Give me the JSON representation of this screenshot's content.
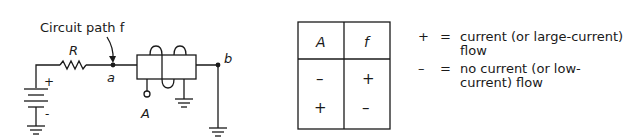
{
  "circuit": {
    "title_label": "Circuit path f",
    "resistor_label": "R",
    "node_a_label": "a",
    "node_b_label": "b",
    "input_label": "A",
    "battery_plus": "+",
    "battery_minus": "-"
  },
  "truth_table": {
    "headers": [
      "A",
      "f"
    ],
    "rows": [
      [
        "–",
        "+"
      ],
      [
        "+",
        "–"
      ]
    ]
  },
  "legend": {
    "items": [
      {
        "symbol": "+",
        "equals": "=",
        "text": "current (or large-current) flow"
      },
      {
        "symbol": "–",
        "equals": "=",
        "text": "no current (or low-current) flow"
      }
    ]
  }
}
